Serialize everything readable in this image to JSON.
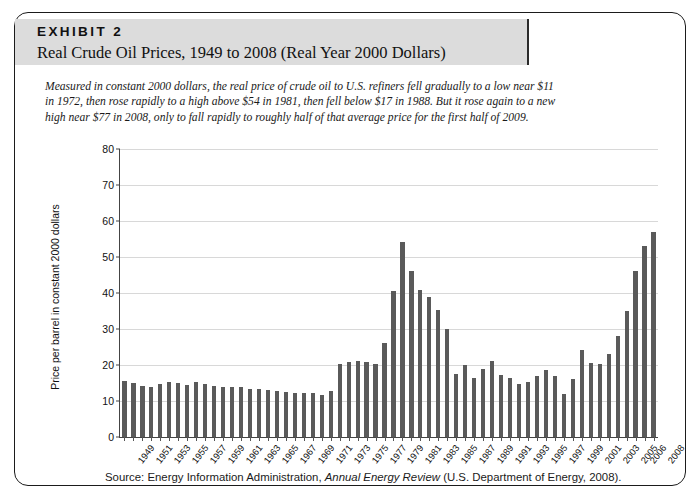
{
  "exhibit": {
    "label": "EXHIBIT 2",
    "title": "Real Crude Oil Prices, 1949 to 2008 (Real Year 2000 Dollars)",
    "description": "Measured in constant 2000 dollars, the real price of crude oil to U.S. refiners fell gradually to a low near $11 in 1972, then rose rapidly to a high above $54 in 1981, then fell below $17 in 1988. But it rose again to a new high near $77 in 2008, only to fall rapidly to roughly half of that average price for the first half of 2009.",
    "source_prefix": "Source:",
    "source_org": "Energy Information Administration,",
    "source_publication": "Annual Energy Review",
    "source_suffix": "(U.S. Department of Energy, 2008)."
  },
  "colors": {
    "bar": "#5a5a5a",
    "grid": "#d8d8d8",
    "axis": "#444444",
    "header_band": "#dcdcdc",
    "border": "#1b1b1b"
  },
  "chart_data": {
    "type": "bar",
    "title": "Real Crude Oil Prices, 1949 to 2008 (Real Year 2000 Dollars)",
    "xlabel": "",
    "ylabel": "Price per barrel in constant 2000 dollars",
    "ylim": [
      0,
      80
    ],
    "yticks": [
      0,
      10,
      20,
      30,
      40,
      50,
      60,
      70,
      80
    ],
    "grid": true,
    "legend": "none",
    "xtick_labels": [
      "1949",
      "1951",
      "1953",
      "1955",
      "1957",
      "1959",
      "1961",
      "1963",
      "1965",
      "1967",
      "1969",
      "1971",
      "1973",
      "1975",
      "1977",
      "1979",
      "1981",
      "1983",
      "1985",
      "1987",
      "1989",
      "1991",
      "1993",
      "1995",
      "1997",
      "1999",
      "2001",
      "2003",
      "2005",
      "2006",
      "2008"
    ],
    "categories": [
      "1949",
      "1950",
      "1951",
      "1952",
      "1953",
      "1954",
      "1955",
      "1956",
      "1957",
      "1958",
      "1959",
      "1960",
      "1961",
      "1962",
      "1963",
      "1964",
      "1965",
      "1966",
      "1967",
      "1968",
      "1969",
      "1970",
      "1971",
      "1972",
      "1973",
      "1974",
      "1975",
      "1976",
      "1977",
      "1978",
      "1979",
      "1980",
      "1981",
      "1982",
      "1983",
      "1984",
      "1985",
      "1986",
      "1987",
      "1988",
      "1989",
      "1990",
      "1991",
      "1992",
      "1993",
      "1994",
      "1995",
      "1996",
      "1997",
      "1998",
      "1999",
      "2000",
      "2001",
      "2002",
      "2003",
      "2004",
      "2005",
      "2006",
      "2007",
      "2008"
    ],
    "values": [
      15.5,
      15.1,
      14.2,
      14.0,
      14.6,
      15.2,
      15.1,
      14.5,
      15.4,
      14.8,
      14.2,
      14.0,
      14.0,
      13.8,
      13.4,
      13.3,
      13.1,
      12.8,
      12.4,
      12.2,
      12.1,
      12.3,
      11.8,
      12.7,
      20.4,
      20.8,
      21.0,
      20.7,
      20.3,
      26.1,
      40.6,
      54.3,
      46.1,
      40.8,
      39.0,
      35.3,
      30.0,
      17.4,
      20.1,
      16.3,
      18.9,
      21.0,
      17.1,
      16.5,
      14.8,
      15.2,
      16.9,
      18.5,
      16.9,
      11.9,
      16.2,
      24.2,
      20.5,
      20.4,
      23.1,
      28.0,
      35.0,
      46.0,
      53.0,
      57.0
    ],
    "highlights": {
      "low_1972": 11.8,
      "peak_1981": 54.3,
      "low_1988": 16.3,
      "peak_2008": 77.5
    }
  }
}
